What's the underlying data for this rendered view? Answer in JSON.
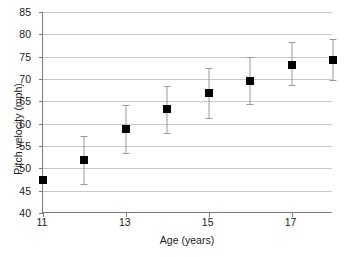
{
  "chart_data": {
    "type": "scatter",
    "title": "",
    "xlabel": "Age (years)",
    "ylabel": "Pitch velocity (mph)",
    "xlim": [
      11,
      18
    ],
    "ylim": [
      40,
      85
    ],
    "ytick_step": 5,
    "xtick_step": 2,
    "grid": true,
    "legend": false,
    "error_bars": "vertical",
    "x": [
      11,
      12,
      13,
      14,
      15,
      16,
      17,
      18
    ],
    "values": [
      47.3,
      51.9,
      58.7,
      63.2,
      66.8,
      69.5,
      73.2,
      74.2
    ],
    "error_low": [
      47.3,
      46.4,
      53.5,
      57.9,
      61.2,
      64.3,
      68.6,
      69.7
    ],
    "error_high": [
      47.3,
      57.2,
      64.1,
      68.4,
      72.5,
      75.0,
      78.2,
      79.0
    ],
    "xticks": [
      11,
      13,
      15,
      17
    ],
    "xtick_labels": [
      "11",
      "13",
      "15",
      "17"
    ],
    "yticks": [
      40,
      45,
      50,
      55,
      60,
      65,
      70,
      75,
      80,
      85
    ],
    "ytick_labels": [
      "40",
      "45",
      "50",
      "55",
      "60",
      "65",
      "70",
      "75",
      "80",
      "85"
    ],
    "marker_color": "#000000",
    "error_bar_color": "#9a9a9a",
    "grid_color": "#c9c9c9",
    "axis_color": "#7a7a7a",
    "background_color": "#ffffff"
  }
}
